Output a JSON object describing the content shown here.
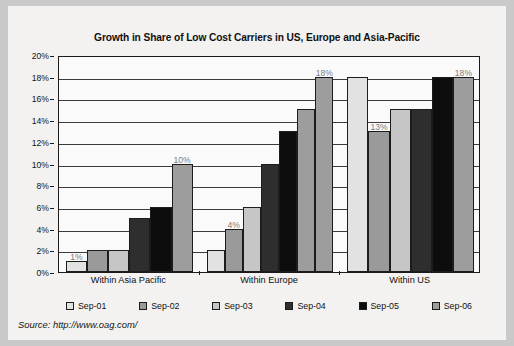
{
  "figure": {
    "title": "Growth in Share of Low Cost Carriers in US, Europe and Asia-Pacific",
    "source": "Source: http://www.oag.com/"
  },
  "legend": {
    "position": "bottom",
    "items": [
      {
        "label": "Sep-01",
        "color": "#e2e2e2"
      },
      {
        "label": "Sep-02",
        "color": "#9a9a9a"
      },
      {
        "label": "Sep-03",
        "color": "#c6c6c6"
      },
      {
        "label": "Sep-04",
        "color": "#2e2e2e"
      },
      {
        "label": "Sep-05",
        "color": "#0d0d0d"
      },
      {
        "label": "Sep-06",
        "color": "#9d9d9d"
      }
    ]
  },
  "axes": {
    "y_ticks": [
      "0%",
      "2%",
      "4%",
      "6%",
      "8%",
      "10%",
      "12%",
      "14%",
      "16%",
      "18%",
      "20%"
    ],
    "x_categories": [
      "Within Asia Pacific",
      "Within Europe",
      "Within US"
    ]
  },
  "chart_data": {
    "type": "bar",
    "title": "Growth in Share of Low Cost Carriers in US, Europe and Asia-Pacific",
    "xlabel": "",
    "ylabel": "",
    "ylim": [
      0,
      20
    ],
    "ytick_step": 2,
    "ytick_format": "percent",
    "grid": true,
    "legend_position": "bottom",
    "categories": [
      "Within Asia Pacific",
      "Within Europe",
      "Within US"
    ],
    "series": [
      {
        "name": "Sep-01",
        "color": "#e2e2e2",
        "values": [
          1,
          2,
          18
        ]
      },
      {
        "name": "Sep-02",
        "color": "#9a9a9a",
        "values": [
          2,
          4,
          13
        ]
      },
      {
        "name": "Sep-03",
        "color": "#c6c6c6",
        "values": [
          2,
          6,
          15
        ]
      },
      {
        "name": "Sep-04",
        "color": "#2e2e2e",
        "values": [
          5,
          10,
          15
        ]
      },
      {
        "name": "Sep-05",
        "color": "#0d0d0d",
        "values": [
          6,
          13,
          18
        ]
      },
      {
        "name": "Sep-06",
        "color": "#9d9d9d",
        "values": [
          10,
          15,
          18
        ]
      }
    ],
    "extra_bars": [
      {
        "category": "Within Europe",
        "name": "Sep-06b",
        "color": "#9d9d9d",
        "value": 18
      }
    ],
    "annotations": [
      {
        "text": "1%",
        "category": "Within Asia Pacific",
        "series": "Sep-01",
        "value": 1
      },
      {
        "text": "10%",
        "category": "Within Asia Pacific",
        "series": "Sep-06",
        "value": 10
      },
      {
        "text": "4%",
        "category": "Within Europe",
        "series": "Sep-02",
        "value": 4
      },
      {
        "text": "18%",
        "category": "Within Europe",
        "series": "Sep-06b",
        "value": 18
      },
      {
        "text": "13%",
        "category": "Within US",
        "series": "Sep-02",
        "value": 13
      },
      {
        "text": "18%",
        "category": "Within US",
        "series": "Sep-06",
        "value": 18
      }
    ]
  }
}
